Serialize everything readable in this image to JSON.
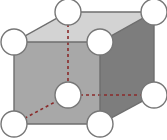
{
  "figure": {
    "name": "body-centered-cubic-unit-cell",
    "width": 167,
    "height": 140,
    "background": "#ffffff",
    "caption": ""
  },
  "colors": {
    "top_face": "#d3d3d3",
    "front_face": "#a8a8a8",
    "right_face": "#7d7d7d",
    "edge_stroke": "#6e6e6e",
    "hidden_edge_stroke": "#8a2a2a",
    "atom_fill": "#ffffff",
    "atom_stroke": "#777777"
  },
  "geometry": {
    "projection": "oblique",
    "vertices": {
      "front_bottom_left": [
        14,
        124
      ],
      "front_bottom_right": [
        100,
        124
      ],
      "front_top_left": [
        14,
        42
      ],
      "front_top_right": [
        100,
        42
      ],
      "back_bottom_left": [
        68,
        95
      ],
      "back_bottom_right": [
        154,
        95
      ],
      "back_top_left": [
        68,
        12
      ],
      "back_top_right": [
        154,
        12
      ]
    },
    "faces": [
      {
        "name": "top-face",
        "points": "14,42 68,12 154,12 100,42",
        "fill_key": "top_face"
      },
      {
        "name": "front-face",
        "points": "14,42 100,42 100,124 14,124",
        "fill_key": "front_face"
      },
      {
        "name": "right-face",
        "points": "100,42 154,12 154,95 100,124",
        "fill_key": "right_face"
      }
    ],
    "solid_edges": [
      {
        "name": "edge-front-top",
        "x1": 14,
        "y1": 42,
        "x2": 100,
        "y2": 42
      },
      {
        "name": "edge-front-left",
        "x1": 14,
        "y1": 42,
        "x2": 14,
        "y2": 124
      },
      {
        "name": "edge-front-right",
        "x1": 100,
        "y1": 42,
        "x2": 100,
        "y2": 124
      },
      {
        "name": "edge-front-bottom",
        "x1": 14,
        "y1": 124,
        "x2": 100,
        "y2": 124
      },
      {
        "name": "edge-top-left-diagonal",
        "x1": 14,
        "y1": 42,
        "x2": 68,
        "y2": 12
      },
      {
        "name": "edge-back-top",
        "x1": 68,
        "y1": 12,
        "x2": 154,
        "y2": 12
      },
      {
        "name": "edge-top-right-diagonal",
        "x1": 100,
        "y1": 42,
        "x2": 154,
        "y2": 12
      },
      {
        "name": "edge-back-right-vertical",
        "x1": 154,
        "y1": 12,
        "x2": 154,
        "y2": 95
      },
      {
        "name": "edge-bottom-right-diagonal",
        "x1": 100,
        "y1": 124,
        "x2": 154,
        "y2": 95
      }
    ],
    "hidden_edges": [
      {
        "name": "hidden-edge-back-left-vertical",
        "x1": 68,
        "y1": 12,
        "x2": 68,
        "y2": 95
      },
      {
        "name": "hidden-edge-back-bottom",
        "x1": 68,
        "y1": 95,
        "x2": 154,
        "y2": 95
      },
      {
        "name": "hidden-edge-bottom-left-diagonal",
        "x1": 14,
        "y1": 124,
        "x2": 68,
        "y2": 95
      }
    ],
    "atoms": [
      {
        "name": "atom-corner-back-top-left",
        "cx": 68,
        "cy": 12,
        "r": 13,
        "position": "corner"
      },
      {
        "name": "atom-corner-back-top-right",
        "cx": 154,
        "cy": 12,
        "r": 13,
        "position": "corner"
      },
      {
        "name": "atom-corner-front-top-left",
        "cx": 14,
        "cy": 42,
        "r": 13,
        "position": "corner"
      },
      {
        "name": "atom-corner-front-top-right",
        "cx": 100,
        "cy": 42,
        "r": 13,
        "position": "corner"
      },
      {
        "name": "atom-corner-back-bottom-right",
        "cx": 154,
        "cy": 95,
        "r": 13,
        "position": "corner"
      },
      {
        "name": "atom-corner-front-bottom-left",
        "cx": 14,
        "cy": 124,
        "r": 13,
        "position": "corner"
      },
      {
        "name": "atom-corner-front-bottom-right",
        "cx": 100,
        "cy": 124,
        "r": 13,
        "position": "corner"
      },
      {
        "name": "atom-body-center",
        "cx": 68,
        "cy": 95,
        "r": 13,
        "position": "body-center"
      }
    ]
  }
}
